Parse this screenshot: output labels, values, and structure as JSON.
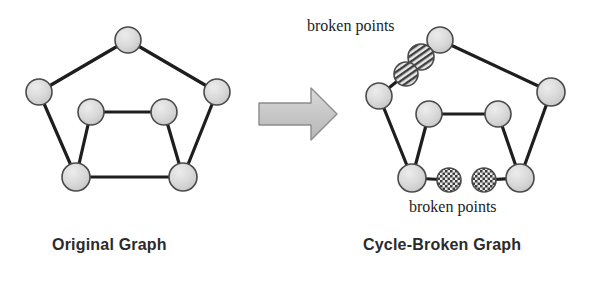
{
  "figure": {
    "background": "#ffffff",
    "width": 609,
    "height": 281
  },
  "colors": {
    "node_fill": "#d2d2d2",
    "node_fill_light": "#dcdcdc",
    "node_stroke": "#4a4a4a",
    "edge": "#1e1e1e",
    "arrow_fill": "#c8c8c8",
    "arrow_stroke": "#8a8a8a",
    "caption_text": "#2b2b2b",
    "label_text": "#1c1c1c",
    "pattern_dark": "#4a4a4a"
  },
  "captions": {
    "left": "Original Graph",
    "right": "Cycle-Broken Graph"
  },
  "annotations": {
    "top_label": "broken points",
    "bottom_label": "broken points"
  },
  "arrow": {
    "name": "transformation-arrow",
    "direction": "right"
  },
  "original_graph": {
    "name": "original-graph",
    "nodes": [
      {
        "id": "o-top",
        "label": "top",
        "cx": 128,
        "cy": 40,
        "r": 13,
        "style": "plain"
      },
      {
        "id": "o-left",
        "label": "left",
        "cx": 39,
        "cy": 92,
        "r": 13,
        "style": "plain"
      },
      {
        "id": "o-right",
        "label": "right",
        "cx": 217,
        "cy": 92,
        "r": 13,
        "style": "plain"
      },
      {
        "id": "o-bl",
        "label": "bottom-left",
        "cx": 76,
        "cy": 177,
        "r": 14,
        "style": "plain"
      },
      {
        "id": "o-br",
        "label": "bottom-right",
        "cx": 183,
        "cy": 177,
        "r": 14,
        "style": "plain"
      },
      {
        "id": "o-itl",
        "label": "inner-top-left",
        "cx": 91,
        "cy": 112,
        "r": 13,
        "style": "plain"
      },
      {
        "id": "o-itr",
        "label": "inner-top-right",
        "cx": 164,
        "cy": 112,
        "r": 13,
        "style": "plain"
      }
    ],
    "edges": [
      {
        "from": "o-left",
        "to": "o-top"
      },
      {
        "from": "o-top",
        "to": "o-right"
      },
      {
        "from": "o-left",
        "to": "o-bl"
      },
      {
        "from": "o-right",
        "to": "o-br"
      },
      {
        "from": "o-bl",
        "to": "o-br"
      },
      {
        "from": "o-itl",
        "to": "o-itr"
      },
      {
        "from": "o-itl",
        "to": "o-bl"
      },
      {
        "from": "o-itr",
        "to": "o-br"
      }
    ]
  },
  "broken_graph": {
    "name": "cycle-broken-graph",
    "nodes": [
      {
        "id": "b-top",
        "label": "top",
        "cx": 440,
        "cy": 40,
        "r": 13,
        "style": "plain"
      },
      {
        "id": "b-left",
        "label": "left",
        "cx": 379,
        "cy": 96,
        "r": 13,
        "style": "plain"
      },
      {
        "id": "b-right",
        "label": "right",
        "cx": 551,
        "cy": 92,
        "r": 14,
        "style": "plain"
      },
      {
        "id": "b-bl",
        "label": "bottom-left",
        "cx": 412,
        "cy": 178,
        "r": 14,
        "style": "plain"
      },
      {
        "id": "b-br",
        "label": "bottom-right",
        "cx": 520,
        "cy": 178,
        "r": 14,
        "style": "plain"
      },
      {
        "id": "b-itl",
        "label": "inner-top-left",
        "cx": 429,
        "cy": 114,
        "r": 13,
        "style": "plain"
      },
      {
        "id": "b-itr",
        "label": "inner-top-right",
        "cx": 498,
        "cy": 114,
        "r": 13,
        "style": "plain"
      },
      {
        "id": "b-bp1",
        "label": "broken-point-top-right",
        "cx": 421,
        "cy": 57,
        "r": 13,
        "style": "striped"
      },
      {
        "id": "b-bp2",
        "label": "broken-point-top-left",
        "cx": 406,
        "cy": 74,
        "r": 12,
        "style": "striped"
      },
      {
        "id": "b-bp3",
        "label": "broken-point-bottom-left",
        "cx": 449,
        "cy": 180,
        "r": 12,
        "style": "checkered"
      },
      {
        "id": "b-bp4",
        "label": "broken-point-bottom-right",
        "cx": 484,
        "cy": 180,
        "r": 12,
        "style": "checkered"
      }
    ],
    "edges": [
      {
        "from": "b-top",
        "to": "b-bp1"
      },
      {
        "from": "b-top",
        "to": "b-right"
      },
      {
        "from": "b-left",
        "to": "b-bp2"
      },
      {
        "from": "b-left",
        "to": "b-bl"
      },
      {
        "from": "b-right",
        "to": "b-br"
      },
      {
        "from": "b-itl",
        "to": "b-itr"
      },
      {
        "from": "b-itl",
        "to": "b-bl"
      },
      {
        "from": "b-itr",
        "to": "b-br"
      },
      {
        "from": "b-bl",
        "to": "b-bp3"
      },
      {
        "from": "b-br",
        "to": "b-bp4"
      }
    ]
  },
  "leader_lines": {
    "top": {
      "from_x": 0,
      "from_y": 0,
      "to_x": 0,
      "to_y": 0
    }
  }
}
